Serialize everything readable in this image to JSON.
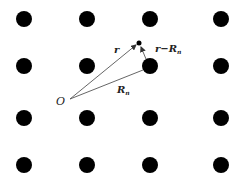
{
  "diagram": {
    "lattice": {
      "columns_x": [
        24,
        87,
        150,
        221
      ],
      "rows_y": [
        19,
        66,
        118,
        165
      ],
      "dot_radius": 8,
      "dot_color": "#000000"
    },
    "origin": {
      "label": "O",
      "x": 70,
      "y": 99
    },
    "point": {
      "x": 139,
      "y": 43,
      "radius": 2.5
    },
    "lattice_site": {
      "x": 150,
      "y": 66
    },
    "vectors": [
      {
        "name": "r",
        "label": "r",
        "from": "origin",
        "to": "point"
      },
      {
        "name": "R_n",
        "label": "R",
        "subscript": "n",
        "from": "origin",
        "to": "lattice_site"
      },
      {
        "name": "r_minus_R_n",
        "label": "r−R",
        "subscript": "n",
        "from": "lattice_site",
        "to": "point"
      }
    ],
    "labels": {
      "r": "r",
      "r_minus_Rn_main": "r−R",
      "r_minus_Rn_sub": "n",
      "Rn_main": "R",
      "Rn_sub": "n",
      "origin": "O"
    }
  }
}
